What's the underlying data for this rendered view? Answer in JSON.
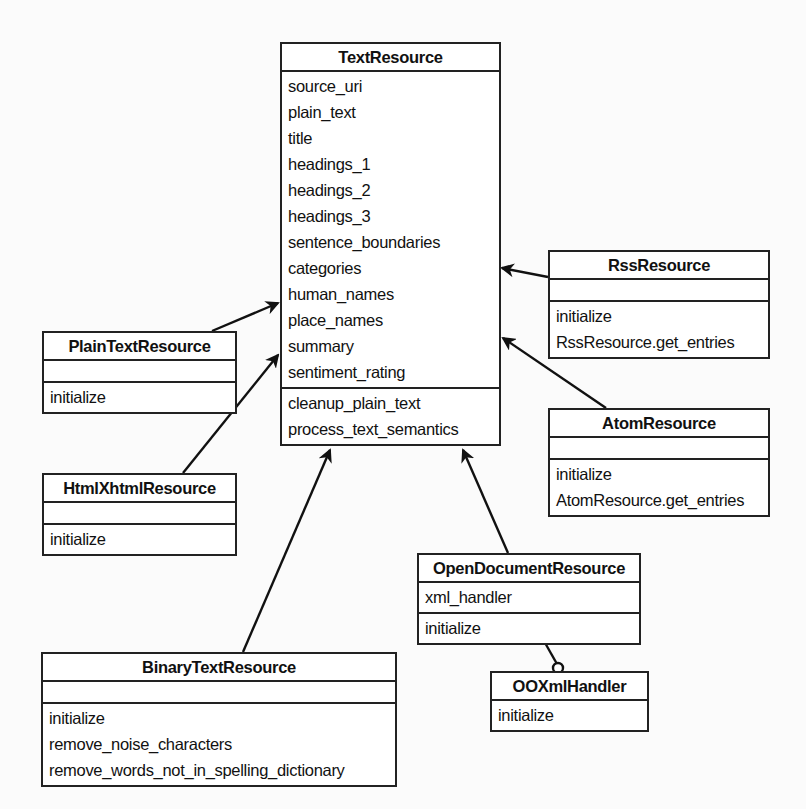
{
  "diagram": {
    "type": "uml-class-diagram",
    "classes": {
      "text_resource": {
        "name": "TextResource",
        "attributes": [
          "source_uri",
          "plain_text",
          "title",
          "headings_1",
          "headings_2",
          "headings_3",
          "sentence_boundaries",
          "categories",
          "human_names",
          "place_names",
          "summary",
          "sentiment_rating"
        ],
        "methods": [
          "cleanup_plain_text",
          "process_text_semantics"
        ]
      },
      "plain_text_resource": {
        "name": "PlainTextResource",
        "attributes": [],
        "methods": [
          "initialize"
        ]
      },
      "html_xhtml_resource": {
        "name": "HtmlXhtmlResource",
        "attributes": [],
        "methods": [
          "initialize"
        ]
      },
      "binary_text_resource": {
        "name": "BinaryTextResource",
        "attributes": [],
        "methods": [
          "initialize",
          "remove_noise_characters",
          "remove_words_not_in_spelling_dictionary"
        ]
      },
      "rss_resource": {
        "name": "RssResource",
        "attributes": [],
        "methods": [
          "initialize",
          "RssResource.get_entries"
        ]
      },
      "atom_resource": {
        "name": "AtomResource",
        "attributes": [],
        "methods": [
          "initialize",
          "AtomResource.get_entries"
        ]
      },
      "open_document_resource": {
        "name": "OpenDocumentResource",
        "attributes": [
          "xml_handler"
        ],
        "methods": [
          "initialize"
        ]
      },
      "ooxml_handler": {
        "name": "OOXmlHandler",
        "methods": [
          "initialize"
        ]
      }
    },
    "relationships": [
      {
        "from": "PlainTextResource",
        "to": "TextResource",
        "kind": "inheritance"
      },
      {
        "from": "HtmlXhtmlResource",
        "to": "TextResource",
        "kind": "inheritance"
      },
      {
        "from": "BinaryTextResource",
        "to": "TextResource",
        "kind": "inheritance"
      },
      {
        "from": "RssResource",
        "to": "TextResource",
        "kind": "inheritance"
      },
      {
        "from": "AtomResource",
        "to": "TextResource",
        "kind": "inheritance"
      },
      {
        "from": "OpenDocumentResource",
        "to": "TextResource",
        "kind": "inheritance"
      },
      {
        "from": "OpenDocumentResource",
        "to": "OOXmlHandler",
        "kind": "association",
        "end_marker": "circle"
      }
    ],
    "colors": {
      "line": "#222222",
      "box_fill": "#ffffff",
      "background": "#fbfbfb"
    }
  }
}
